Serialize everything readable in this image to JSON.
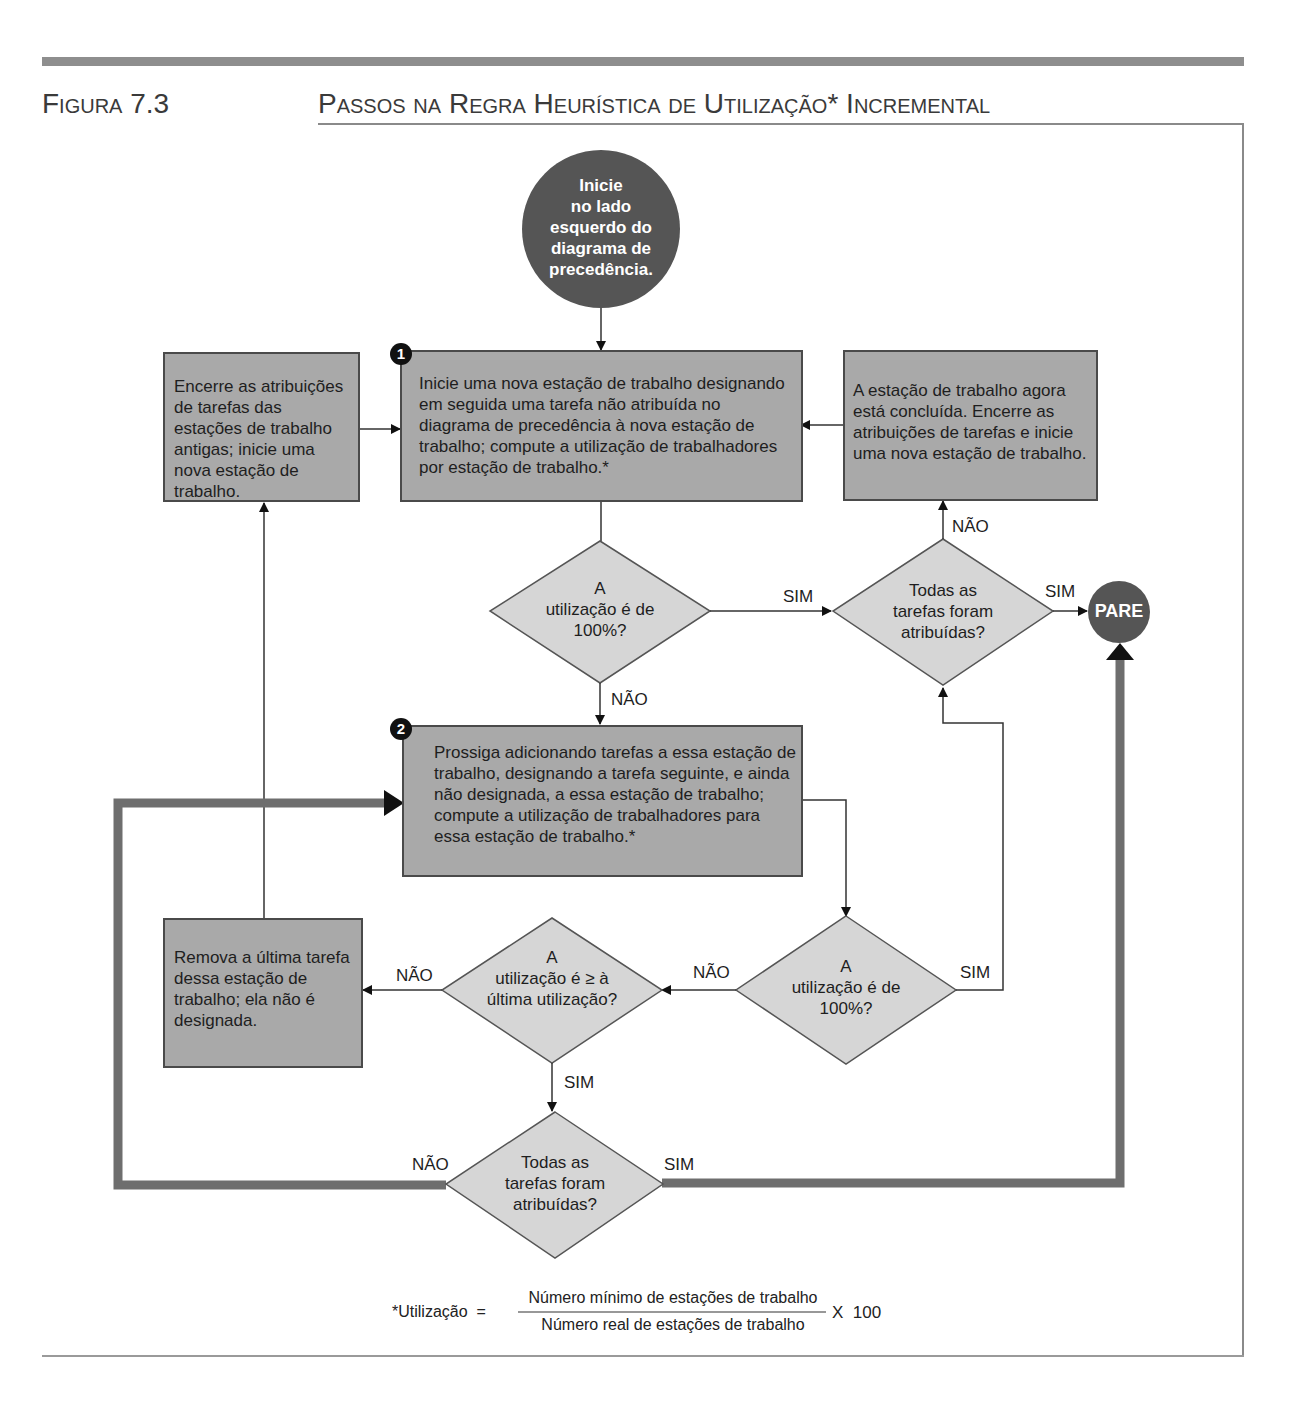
{
  "header": {
    "figure_label": "Figura 7.3",
    "title": "Passos na Regra Heurística de Utilização* Incremental"
  },
  "nodes": {
    "start": "Inicie\nno lado\nesquerdo do\ndiagrama de\nprecedência.",
    "step1_badge": "1",
    "step1": "Inicie uma nova estação de trabalho designando em seguida uma tarefa não atribuída no diagrama de precedência à nova estação de trabalho; compute a utilização de trabalhadores por estação de trabalho.*",
    "close_old": "Encerre as atribuições de tarefas das estações de trabalho antigas; inicie uma nova estação de trabalho.",
    "station_done": "A estação de trabalho agora está concluída. Encerre as atribuições de tarefas e inicie uma nova estação de trabalho.",
    "decision_util_100_top": "A\nutilização é de\n100%?",
    "decision_all_assigned_top": "Todas as\ntarefas foram\natribuídas?",
    "stop": "PARE",
    "step2_badge": "2",
    "step2": "Prossiga adicionando tarefas a essa estação de trabalho, designando a tarefa seguinte, e ainda não designada, a essa estação de trabalho; compute a utilização de trabalhadores para essa estação de trabalho.*",
    "decision_util_100_bottom": "A\nutilização é de\n100%?",
    "decision_util_ge_last": "A\nutilização é ≥ à\núltima utilização?",
    "remove_last": "Remova a última tarefa dessa estação de trabalho; ela não é designada.",
    "decision_all_assigned_bottom": "Todas as\ntarefas foram\natribuídas?"
  },
  "edge_labels": {
    "yes": "SIM",
    "no": "NÃO"
  },
  "footnote": {
    "lhs": "*Utilização  =",
    "numerator": "Número mínimo de estações de trabalho",
    "denominator": "Número real de estações de trabalho",
    "multiplier": "X  100"
  },
  "colors": {
    "box_fill": "#a9a9a9",
    "diamond_fill": "#d6d6d6",
    "circle_fill": "#555555",
    "thick_loop": "#6e6e6e",
    "rule": "#8e8e8e"
  }
}
